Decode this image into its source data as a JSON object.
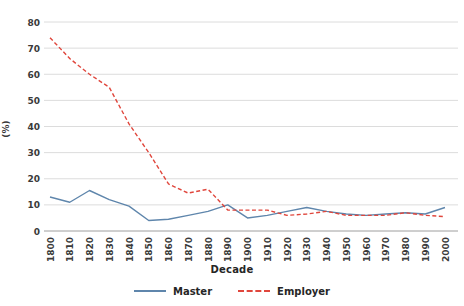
{
  "chart_data": {
    "type": "line",
    "title": "",
    "xlabel": "Decade",
    "ylabel": "(%)",
    "ylim": [
      0,
      80
    ],
    "ytick_step": 10,
    "grid": "horizontal",
    "legend_position": "bottom",
    "text_color": "#3a3a3a",
    "grid_color": "#dcdcdc",
    "axis_color": "#9e9e9e",
    "categories": [
      "1800",
      "1810",
      "1820",
      "1830",
      "1840",
      "1850",
      "1860",
      "1870",
      "1880",
      "1890",
      "1900",
      "1910",
      "1920",
      "1930",
      "1940",
      "1950",
      "1960",
      "1970",
      "1980",
      "1990",
      "2000"
    ],
    "series": [
      {
        "name": "Master",
        "color": "#5f86ac",
        "style": "solid",
        "values": [
          13,
          11,
          15.5,
          12,
          9.5,
          4,
          4.5,
          6,
          7.5,
          10,
          5,
          6,
          7.5,
          9,
          7.5,
          6.5,
          6,
          6.5,
          7,
          6.5,
          9
        ]
      },
      {
        "name": "Employer",
        "color": "#e0463c",
        "style": "dashed",
        "values": [
          74,
          66,
          60,
          55,
          41,
          30,
          18,
          14.5,
          16,
          8,
          8,
          8,
          6,
          6.5,
          7.5,
          6,
          6,
          6,
          7,
          6,
          5.5
        ]
      }
    ]
  }
}
